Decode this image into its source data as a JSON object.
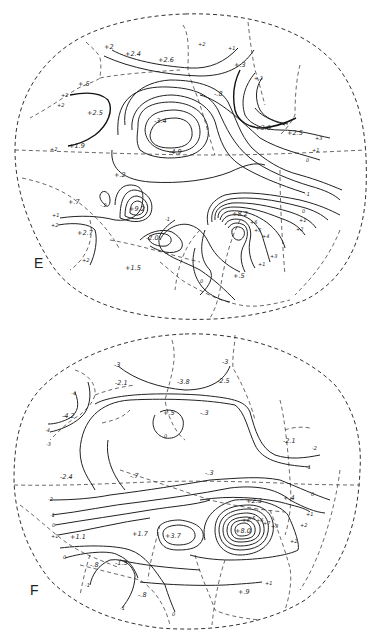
{
  "figure": {
    "panels": [
      {
        "id": "E",
        "letter": "E",
        "labels": {
          "p2a": "+2",
          "p24": "+2.4",
          "p26": "+2.6",
          "p2b": "+2",
          "p1a": "+1",
          "p3": "+.3",
          "p5": "+.5",
          "p1b": "+1",
          "p2c": "+2",
          "p25": "+2.5",
          "p19": "+1.9",
          "p2d": "+2",
          "m34": "-3.4",
          "m49": "-4.9",
          "m8": "-.8",
          "p3b": "+.3",
          "p30": "+3.0",
          "p25b": "+2.5",
          "p3c": "+3",
          "p1c": "+1",
          "o1": "0",
          "p2e": "+.2",
          "p7": "+.7",
          "m2": "-.2",
          "p92": "+9.2",
          "p1d": "+1",
          "p2f": "+2",
          "p27": "+2.7",
          "p2g": "+2",
          "m20": "-2.0",
          "m1": "-1",
          "p15": "+1.5",
          "p82": "+8.2",
          "m4": "-4",
          "m3": "-3",
          "m2b": "-2",
          "m1b": "-1",
          "o2": "0",
          "p1e": "+1",
          "p2h": "+2",
          "p3d": "+3",
          "p4": "+4",
          "p5b": "+5",
          "p6": "+6",
          "o3": "0",
          "p5c": "+.5",
          "p1f": "+1"
        }
      },
      {
        "id": "F",
        "letter": "F",
        "labels": {
          "m3a": "-3",
          "m21": "-2.1",
          "m38": "-3.8",
          "m3b": "-3",
          "m25": "-2.5",
          "m4": "-4",
          "m42": "-4.2",
          "m4b": "-4",
          "m3c": "-3",
          "p5": "+.5",
          "o1": "0",
          "m3d": "-.3",
          "m21b": "-2.1",
          "m2": "-2",
          "m1": "-1",
          "m24": "-2.4",
          "m7": "-.7",
          "m3e": "-.3",
          "m2b": "-2",
          "m1b": "-1",
          "o2": "0",
          "p1": "+1",
          "p11": "+1.1",
          "p17": "+1.7",
          "p37": "+3.7",
          "p23": "+2.3",
          "p4": "+.4",
          "o3": "0",
          "p1b": "+1",
          "p2": "+2",
          "p8": "+8.0",
          "p4b": "+4",
          "p5b": "+5",
          "p6": "+6",
          "p7": "+7",
          "p3": "+3",
          "p2b": "+2",
          "p1c": "+1",
          "o4": "0",
          "m8": "-.8",
          "m15": "-1.5",
          "m1c": "-1",
          "m8b": "-.8",
          "m1d": "-1",
          "o5": "0",
          "p9": "+.9",
          "p1d": "+1",
          "p1e": "+1"
        }
      }
    ]
  }
}
